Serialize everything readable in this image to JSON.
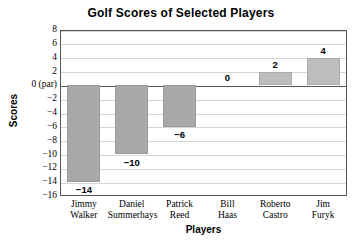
{
  "chart_data": {
    "type": "bar",
    "title": "Golf Scores of Selected Players",
    "xlabel": "Players",
    "ylabel": "Scores",
    "categories": [
      "Jimmy Walker",
      "Daniel Summerhays",
      "Patrick Reed",
      "Bill Haas",
      "Roberto Castro",
      "Jim Furyk"
    ],
    "category_lines": [
      [
        "Jimmy",
        "Walker"
      ],
      [
        "Daniel",
        "Summerhays"
      ],
      [
        "Patrick",
        "Reed"
      ],
      [
        "Bill",
        "Haas"
      ],
      [
        "Roberto",
        "Castro"
      ],
      [
        "Jim",
        "Furyk"
      ]
    ],
    "values": [
      -14,
      -10,
      -6,
      0,
      2,
      4
    ],
    "value_labels": [
      "−14",
      "−10",
      "−6",
      "0",
      "2",
      "4"
    ],
    "ylim": [
      -16,
      8
    ],
    "ytick_values": [
      8,
      6,
      4,
      2,
      0,
      -2,
      -4,
      -6,
      -8,
      -10,
      -12,
      -14,
      -16
    ],
    "ytick_labels": [
      "8",
      "6",
      "4",
      "2",
      "0 (par)",
      "−2",
      "−4",
      "−6",
      "−8",
      "−10",
      "−12",
      "−14",
      "−16"
    ],
    "grid": true,
    "legend": "none",
    "bar_color": "#a9a9a9",
    "positive_bar_color": "#bdbdbd",
    "grid_color": "#d6d6d6",
    "axis_color": "#555555",
    "background": "#ffffff"
  }
}
